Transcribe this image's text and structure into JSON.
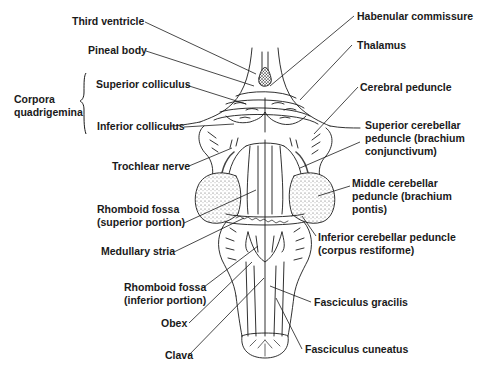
{
  "diagram": {
    "colors": {
      "ink": "#1a1a1a",
      "background": "#ffffff",
      "stipple": "#555555"
    },
    "group_label": {
      "line1": "Corpora",
      "line2": "quadrigemina"
    },
    "labels_left": [
      {
        "id": "third-ventricle",
        "line1": "Third ventricle"
      },
      {
        "id": "pineal-body",
        "line1": "Pineal body"
      },
      {
        "id": "superior-colliculus",
        "line1": "Superior colliculus"
      },
      {
        "id": "inferior-colliculus",
        "line1": "Inferior colliculus"
      },
      {
        "id": "trochlear-nerve",
        "line1": "Trochlear nerve"
      },
      {
        "id": "rhomboid-fossa-superior",
        "line1": "Rhomboid fossa",
        "line2": "(superior portion)"
      },
      {
        "id": "medullary-stria",
        "line1": "Medullary stria"
      },
      {
        "id": "rhomboid-fossa-inferior",
        "line1": "Rhomboid fossa",
        "line2": "(inferior portion)"
      },
      {
        "id": "obex",
        "line1": "Obex"
      },
      {
        "id": "clava",
        "line1": "Clava"
      }
    ],
    "labels_right": [
      {
        "id": "habenular-commissure",
        "line1": "Habenular commissure"
      },
      {
        "id": "thalamus",
        "line1": "Thalamus"
      },
      {
        "id": "cerebral-peduncle",
        "line1": "Cerebral peduncle"
      },
      {
        "id": "superior-cerebellar-peduncle",
        "line1": "Superior cerebellar",
        "line2": "peduncle (brachium",
        "line3": "conjunctivum)"
      },
      {
        "id": "middle-cerebellar-peduncle",
        "line1": "Middle cerebellar",
        "line2": "peduncle (brachium",
        "line3": "pontis)"
      },
      {
        "id": "inferior-cerebellar-peduncle",
        "line1": "Inferior cerebellar peduncle",
        "line2": "(corpus restiforme)"
      },
      {
        "id": "fasciculus-gracilis",
        "line1": "Fasciculus gracilis"
      },
      {
        "id": "fasciculus-cuneatus",
        "line1": "Fasciculus cuneatus"
      }
    ]
  }
}
